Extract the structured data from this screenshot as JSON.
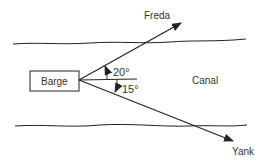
{
  "labels": {
    "barge": "Barge",
    "canal": "Canal",
    "freda": "Freda",
    "yank": "Yank",
    "angle_upper": "20°",
    "angle_lower": "15°"
  },
  "colors": {
    "ink": "#222222",
    "background": "#ffffff"
  }
}
